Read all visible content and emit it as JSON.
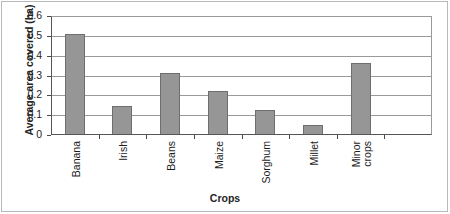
{
  "chart_data": {
    "type": "bar",
    "title": "",
    "xlabel": "Crops",
    "ylabel": "Average area covered (ha)",
    "categories": [
      "Banana",
      "Irish",
      "Beans",
      "Maize",
      "Sorghum",
      "Millet",
      "Minor crops"
    ],
    "values": [
      0.51,
      0.145,
      0.315,
      0.22,
      0.125,
      0.05,
      0.365
    ],
    "ylim": [
      0,
      0.6
    ],
    "yticks": [
      "0",
      "0.1",
      "0.2",
      "0.3",
      "0.4",
      "0.5",
      "0.6"
    ],
    "ytick_values": [
      0,
      0.1,
      0.2,
      0.3,
      0.4,
      0.5,
      0.6
    ],
    "grid": "horizontal",
    "legend": "none",
    "bar_color": "#969696",
    "bar_edge_color": "#6e6e6e",
    "axis_color": "#555555",
    "gridline_color": "#9a9a9a",
    "empty_trailing_slot": true,
    "category_label_rotation": -90,
    "multiline_categories": {
      "Minor crops": [
        "Minor",
        "crops"
      ]
    }
  }
}
